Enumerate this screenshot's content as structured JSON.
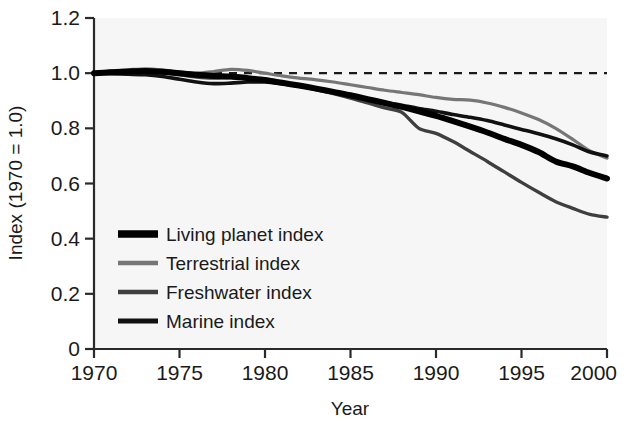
{
  "chart_data": {
    "type": "line",
    "title": "",
    "xlabel": "Year",
    "ylabel": "Index (1970 = 1.0)",
    "xlim": [
      1970,
      2000
    ],
    "ylim": [
      0,
      1.2
    ],
    "xticks": [
      1970,
      1975,
      1980,
      1985,
      1990,
      1995,
      2000
    ],
    "xtick_labels": [
      "1970",
      "1975",
      "1980",
      "1985",
      "1990",
      "1995",
      "2000"
    ],
    "yticks": [
      0,
      0.2,
      0.4,
      0.6,
      0.8,
      1.0,
      1.2
    ],
    "ytick_labels": [
      "0",
      "0.2",
      "0.4",
      "0.6",
      "0.8",
      "1.0",
      "1.2"
    ],
    "grid": false,
    "legend_position": "lower-left-inside",
    "reference_line": {
      "name": "baseline-1.0",
      "value": 1.0,
      "style": "dashed",
      "color": "#1a1a1a"
    },
    "x": [
      1970,
      1971,
      1972,
      1973,
      1974,
      1975,
      1976,
      1977,
      1978,
      1979,
      1980,
      1981,
      1982,
      1983,
      1984,
      1985,
      1986,
      1987,
      1988,
      1989,
      1990,
      1991,
      1992,
      1993,
      1994,
      1995,
      1996,
      1997,
      1998,
      1999,
      2000
    ],
    "series": [
      {
        "name": "Living planet index",
        "color": "#000000",
        "width": 6.0,
        "values": [
          1.0,
          1.003,
          1.006,
          1.008,
          1.005,
          1.0,
          0.994,
          0.99,
          0.988,
          0.982,
          0.975,
          0.965,
          0.955,
          0.944,
          0.932,
          0.92,
          0.906,
          0.892,
          0.878,
          0.862,
          0.845,
          0.826,
          0.806,
          0.785,
          0.762,
          0.74,
          0.714,
          0.68,
          0.662,
          0.638,
          0.618
        ]
      },
      {
        "name": "Terrestrial index",
        "color": "#767676",
        "width": 3.2,
        "values": [
          1.0,
          1.008,
          1.012,
          1.016,
          1.012,
          1.004,
          1.0,
          1.006,
          1.014,
          1.01,
          1.0,
          0.99,
          0.982,
          0.976,
          0.968,
          0.958,
          0.948,
          0.938,
          0.93,
          0.922,
          0.912,
          0.905,
          0.902,
          0.892,
          0.876,
          0.856,
          0.832,
          0.8,
          0.76,
          0.718,
          0.692
        ]
      },
      {
        "name": "Freshwater index",
        "color": "#3f3f3f",
        "width": 3.4,
        "values": [
          1.0,
          1.004,
          1.006,
          1.004,
          1.0,
          0.994,
          0.986,
          0.982,
          0.984,
          0.98,
          0.972,
          0.962,
          0.952,
          0.94,
          0.926,
          0.91,
          0.892,
          0.874,
          0.858,
          0.8,
          0.782,
          0.752,
          0.716,
          0.68,
          0.642,
          0.604,
          0.568,
          0.534,
          0.51,
          0.488,
          0.478
        ]
      },
      {
        "name": "Marine index",
        "color": "#111111",
        "width": 3.6,
        "values": [
          1.0,
          0.998,
          0.996,
          0.994,
          0.988,
          0.978,
          0.968,
          0.962,
          0.964,
          0.968,
          0.968,
          0.962,
          0.954,
          0.944,
          0.932,
          0.92,
          0.906,
          0.894,
          0.884,
          0.872,
          0.862,
          0.85,
          0.84,
          0.828,
          0.812,
          0.796,
          0.78,
          0.762,
          0.74,
          0.714,
          0.7
        ]
      }
    ]
  },
  "axes": {
    "y_title": "Index (1970 = 1.0)",
    "x_title": "Year"
  },
  "legend": {
    "items": [
      {
        "label": "Living planet index",
        "color": "#000000",
        "width": 7.5
      },
      {
        "label": "Terrestrial index",
        "color": "#767676",
        "width": 4.5
      },
      {
        "label": "Freshwater index",
        "color": "#3f3f3f",
        "width": 4.5
      },
      {
        "label": "Marine index",
        "color": "#111111",
        "width": 5.0
      }
    ]
  }
}
